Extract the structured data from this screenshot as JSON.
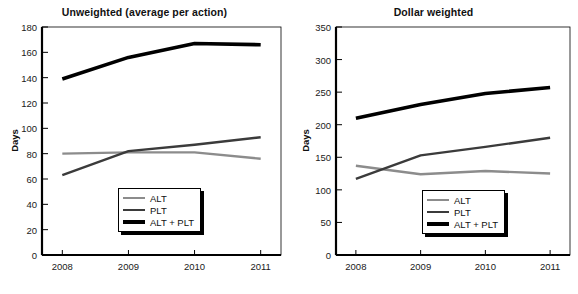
{
  "chart_data": [
    {
      "type": "line",
      "title": "Unweighted (average per action)",
      "xlabel": "",
      "ylabel": "Days",
      "categories": [
        "2008",
        "2009",
        "2010",
        "2011"
      ],
      "x": [
        2008,
        2009,
        2010,
        2011
      ],
      "ylim": [
        0,
        180
      ],
      "ytick_step": 20,
      "yticks": [
        "0",
        "20",
        "40",
        "60",
        "80",
        "100",
        "120",
        "140",
        "160",
        "180"
      ],
      "grid": false,
      "legend_position": "bottom-center",
      "series": [
        {
          "name": "ALT",
          "values": [
            80,
            81,
            81,
            76
          ],
          "color": "#8c8c8c",
          "width": 2.4
        },
        {
          "name": "PLT",
          "values": [
            63,
            82,
            87,
            93
          ],
          "color": "#3b3b3b",
          "width": 2.4
        },
        {
          "name": "ALT + PLT",
          "values": [
            139,
            156,
            167,
            166
          ],
          "color": "#000000",
          "width": 3.6
        }
      ]
    },
    {
      "type": "line",
      "title": "Dollar weighted",
      "xlabel": "",
      "ylabel": "Days",
      "categories": [
        "2008",
        "2009",
        "2010",
        "2011"
      ],
      "x": [
        2008,
        2009,
        2010,
        2011
      ],
      "ylim": [
        0,
        350
      ],
      "ytick_step": 50,
      "yticks": [
        "0",
        "50",
        "100",
        "150",
        "200",
        "250",
        "300",
        "350"
      ],
      "grid": false,
      "legend_position": "bottom-center",
      "series": [
        {
          "name": "ALT",
          "values": [
            137,
            124,
            129,
            125
          ],
          "color": "#8c8c8c",
          "width": 2.4
        },
        {
          "name": "PLT",
          "values": [
            117,
            153,
            166,
            180
          ],
          "color": "#3b3b3b",
          "width": 2.4
        },
        {
          "name": "ALT + PLT",
          "values": [
            210,
            231,
            248,
            257
          ],
          "color": "#000000",
          "width": 3.6
        }
      ]
    }
  ],
  "legend": {
    "entries": [
      "ALT",
      "PLT",
      "ALT + PLT"
    ]
  },
  "colors": {
    "alt": "#8c8c8c",
    "plt": "#3b3b3b",
    "alt_plt": "#000000",
    "axis": "#000000",
    "background": "#ffffff"
  }
}
